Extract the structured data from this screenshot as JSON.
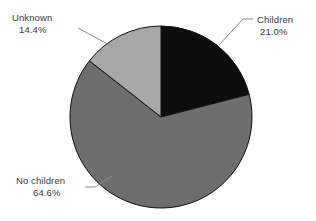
{
  "chart_data": {
    "type": "pie",
    "title": "",
    "categories": [
      "Children",
      "No children",
      "Unknown"
    ],
    "values": [
      21.0,
      64.6,
      14.4
    ],
    "value_suffix": "%",
    "labels": [
      {
        "name": "Children",
        "value": "21.0%",
        "color": "#0d0d0d"
      },
      {
        "name": "No children",
        "value": "64.6%",
        "color": "#6e6e6e"
      },
      {
        "name": "Unknown",
        "value": "14.4%",
        "color": "#a8a8a8"
      }
    ],
    "legend_position": "callout-labels",
    "grid": false,
    "start_angle_deg": 0,
    "direction": "clockwise",
    "slice_colors": [
      "#0d0d0d",
      "#6e6e6e",
      "#a8a8a8"
    ],
    "slice_border_color": "#101010",
    "leader_line_color": "#8d8d8d",
    "background_color": "#ffffff",
    "text_color": "#3a3a3a",
    "geometry": {
      "center_x": 161,
      "center_y": 117,
      "radius": 91
    }
  }
}
